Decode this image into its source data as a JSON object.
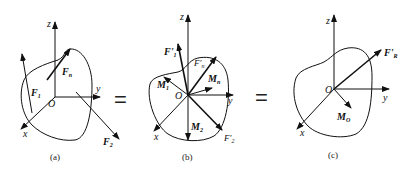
{
  "figure": {
    "panels": [
      {
        "id": "a",
        "caption": "(a)",
        "axes": {
          "z": "z",
          "y": "y",
          "x": "x",
          "origin": "O"
        },
        "forces": [
          {
            "label": "F",
            "sub": "1"
          },
          {
            "label": "F",
            "sub": "n"
          },
          {
            "label": "F",
            "sub": "2"
          }
        ]
      },
      {
        "id": "b",
        "caption": "(b)",
        "axes": {
          "z": "z",
          "y": "y",
          "x": "x",
          "origin": "O"
        },
        "forces": [
          {
            "label": "F'",
            "sub": "1"
          },
          {
            "label": "F'",
            "sub": "n"
          },
          {
            "label": "F'",
            "sub": "2"
          }
        ],
        "moments": [
          {
            "label": "M",
            "sub": "1"
          },
          {
            "label": "M",
            "sub": "n"
          },
          {
            "label": "M",
            "sub": "2"
          }
        ]
      },
      {
        "id": "c",
        "caption": "(c)",
        "axes": {
          "z": "z",
          "y": "y",
          "x": "x",
          "origin": "O"
        },
        "forces": [
          {
            "label": "F'",
            "sub": "R"
          }
        ],
        "moments": [
          {
            "label": "M",
            "sub": "O"
          }
        ]
      }
    ],
    "equals": [
      "=",
      "="
    ]
  }
}
